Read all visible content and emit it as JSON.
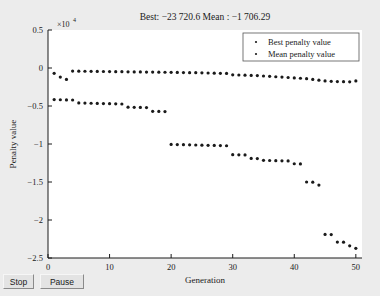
{
  "window": {
    "background_color": "#ececec"
  },
  "controls": {
    "stop_label": "Stop",
    "pause_label": "Pause"
  },
  "chart_data": {
    "type": "scatter",
    "title": "Best: −23 720.6 Mean : −1 706.29",
    "xlabel": "Generation",
    "ylabel": "Penalty value",
    "exponent_label": "×10",
    "exponent_power": "4",
    "xlim": [
      0,
      51
    ],
    "ylim": [
      -2.5,
      0.5
    ],
    "xticks": [
      0,
      10,
      20,
      30,
      40,
      50
    ],
    "xticklabels": [
      "0",
      "10",
      "20",
      "30",
      "40",
      "50"
    ],
    "yticks": [
      0.5,
      0,
      -0.5,
      -1,
      -1.5,
      -2,
      -2.5
    ],
    "yticklabels": [
      "0.5",
      "0",
      "−0.5",
      "−1",
      "−1.5",
      "−2",
      "−2.5"
    ],
    "y_scale_factor": 10000,
    "grid": false,
    "legend_position": "upper right",
    "marker_color": "#1a1a1a",
    "marker_size": 1.6,
    "legend": [
      {
        "label": "Best penalty value",
        "marker_color": "#1a1a1a"
      },
      {
        "label": "Mean penalty value",
        "marker_color": "#1a1a1a"
      }
    ],
    "series": [
      {
        "name": "Best penalty value",
        "x": [
          1,
          2,
          3,
          4,
          5,
          6,
          7,
          8,
          9,
          10,
          11,
          12,
          13,
          14,
          15,
          16,
          17,
          18,
          19,
          20,
          21,
          22,
          23,
          24,
          25,
          26,
          27,
          28,
          29,
          30,
          31,
          32,
          33,
          34,
          35,
          36,
          37,
          38,
          39,
          40,
          41,
          42,
          43,
          44,
          45,
          46,
          47,
          48,
          49,
          50
        ],
        "values": [
          -4150,
          -4180,
          -4200,
          -4210,
          -4600,
          -4620,
          -4640,
          -4660,
          -4680,
          -4700,
          -4720,
          -4740,
          -5150,
          -5170,
          -5190,
          -5210,
          -5700,
          -5720,
          -5740,
          -10050,
          -10070,
          -10090,
          -10110,
          -10130,
          -10150,
          -10170,
          -10190,
          -10210,
          -10230,
          -11400,
          -11420,
          -11440,
          -11900,
          -11920,
          -12150,
          -12170,
          -12190,
          -12210,
          -12230,
          -12600,
          -12620,
          -15000,
          -15020,
          -15400,
          -21900,
          -21920,
          -22900,
          -22920,
          -23400,
          -23720.6
        ]
      },
      {
        "name": "Mean penalty value",
        "x": [
          1,
          2,
          3,
          4,
          5,
          6,
          7,
          8,
          9,
          10,
          11,
          12,
          13,
          14,
          15,
          16,
          17,
          18,
          19,
          20,
          21,
          22,
          23,
          24,
          25,
          26,
          27,
          28,
          29,
          30,
          31,
          32,
          33,
          34,
          35,
          36,
          37,
          38,
          39,
          40,
          41,
          42,
          43,
          44,
          45,
          46,
          47,
          48,
          49,
          50
        ],
        "values": [
          -700,
          -1200,
          -1500,
          -400,
          -420,
          -430,
          -440,
          -450,
          -460,
          -470,
          -480,
          -490,
          -500,
          -510,
          -520,
          -530,
          -540,
          -550,
          -560,
          -570,
          -580,
          -600,
          -610,
          -620,
          -640,
          -660,
          -680,
          -700,
          -720,
          -900,
          -920,
          -950,
          -980,
          -1000,
          -1050,
          -1100,
          -1150,
          -1200,
          -1250,
          -1300,
          -1350,
          -1400,
          -1500,
          -1600,
          -1700,
          -1750,
          -1780,
          -1800,
          -1820,
          -1706.29
        ]
      }
    ]
  }
}
